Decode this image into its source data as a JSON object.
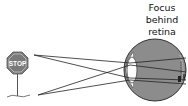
{
  "diagram": {
    "title_lines": [
      "Focus",
      "behind",
      "retina"
    ],
    "object": {
      "type": "stop-sign",
      "text": "STOP",
      "color": "#7a7a7a"
    },
    "eye": {
      "fill": "#8c8c8c",
      "outline": "#333333"
    },
    "rays": {
      "color": "#222222"
    }
  }
}
